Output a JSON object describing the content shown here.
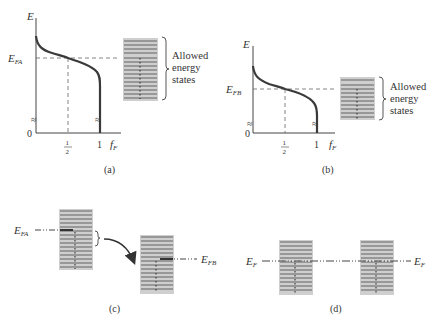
{
  "colors": {
    "ink": "#333333",
    "curve": "#3a3a3a",
    "band_fill": "#c9c9c9",
    "level_line": "#555555",
    "occupied_dot": "#222222",
    "dash": "#555555"
  },
  "panel_a": {
    "y_axis_label": "E",
    "x_axis_label": "f",
    "x_axis_sub": "F",
    "fermi_label": "E",
    "fermi_sub": "FA",
    "origin": "0",
    "tick_half_num": "1",
    "tick_half_den": "2",
    "tick_one": "1",
    "caption": "(a)",
    "legend_line1": "Allowed",
    "legend_line2": "energy",
    "legend_line3": "states",
    "break_mark": "≈"
  },
  "panel_b": {
    "y_axis_label": "E",
    "x_axis_label": "f",
    "x_axis_sub": "F",
    "fermi_label": "E",
    "fermi_sub": "FB",
    "origin": "0",
    "tick_half_num": "1",
    "tick_half_den": "2",
    "tick_one": "1",
    "caption": "(b)",
    "legend_line1": "Allowed",
    "legend_line2": "energy",
    "legend_line3": "states",
    "break_mark": "≈"
  },
  "panel_c": {
    "left_label": "E",
    "left_sub": "FA",
    "right_label": "E",
    "right_sub": "FB",
    "caption": "(c)"
  },
  "panel_d": {
    "left_label": "E",
    "left_sub": "F",
    "right_label": "E",
    "right_sub": "F",
    "caption": "(d)"
  }
}
